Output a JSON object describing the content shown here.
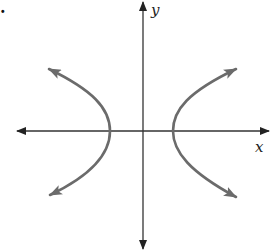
{
  "figure": {
    "corner_mark": ".",
    "axes": {
      "x_label": "x",
      "y_label": "y",
      "origin_px": [
        143,
        131
      ],
      "x_extent_px": [
        18,
        268
      ],
      "y_extent_px": [
        2,
        248
      ]
    },
    "curve": {
      "type": "hyperbola",
      "orientation": "horizontal transverse axis",
      "branches": [
        {
          "name": "left",
          "vertex_px": [
            110,
            131
          ],
          "upper_end_px": [
            48,
            68
          ],
          "lower_end_px": [
            48,
            196
          ]
        },
        {
          "name": "right",
          "vertex_px": [
            173,
            131
          ],
          "upper_end_px": [
            237,
            68
          ],
          "lower_end_px": [
            237,
            198
          ]
        }
      ],
      "color": "#6b6b6b"
    },
    "axis_color": "#333333"
  }
}
